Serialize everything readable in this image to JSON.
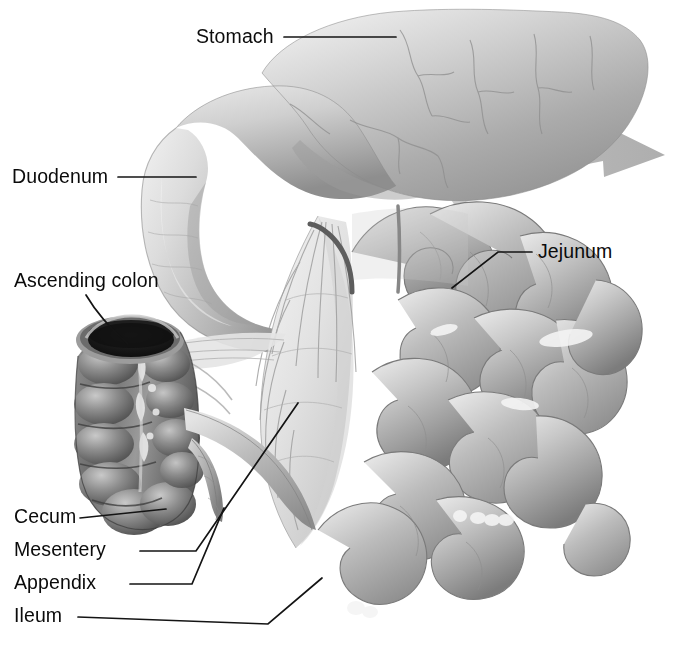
{
  "figure": {
    "background_color": "#ffffff",
    "label_color": "#0b0b0b",
    "leader_line_color": "#141414",
    "arrow_color": "#b9b9b9",
    "tissue_light": "#e2e2e2",
    "tissue_mid": "#b5b5b5",
    "tissue_dark": "#6f6f6f",
    "lumen_color": "#1d1d1d"
  },
  "labels": {
    "stomach": "Stomach",
    "duodenum": "Duodenum",
    "ascending_colon": "Ascending colon",
    "jejunum": "Jejunum",
    "cecum": "Cecum",
    "mesentery": "Mesentery",
    "appendix": "Appendix",
    "ileum": "Ileum"
  },
  "structures": [
    {
      "name": "stomach",
      "label": "Stomach"
    },
    {
      "name": "duodenum",
      "label": "Duodenum"
    },
    {
      "name": "ascending-colon",
      "label": "Ascending colon"
    },
    {
      "name": "jejunum",
      "label": "Jejunum"
    },
    {
      "name": "cecum",
      "label": "Cecum"
    },
    {
      "name": "mesentery",
      "label": "Mesentery"
    },
    {
      "name": "appendix",
      "label": "Appendix"
    },
    {
      "name": "ileum",
      "label": "Ileum"
    }
  ],
  "annotations": {
    "flow_arrow": "curved-arrow-right"
  }
}
